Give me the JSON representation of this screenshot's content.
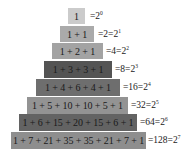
{
  "rows": [
    {
      "n": 0,
      "expression": "1",
      "sum_text": "=2",
      "exponent": "0",
      "color": "#cbcbcb"
    },
    {
      "n": 1,
      "expression": "1 + 1",
      "sum_text": "=2=2",
      "exponent": "1",
      "color": "#aaaaaa"
    },
    {
      "n": 2,
      "expression": "1 + 2 + 1",
      "sum_text": "=4=2",
      "exponent": "2",
      "color": "#a3a3a3"
    },
    {
      "n": 3,
      "expression": "1 + 3 + 3 + 1",
      "sum_text": "=8=2",
      "exponent": "3",
      "color": "#545454"
    },
    {
      "n": 4,
      "expression": "1 + 4 + 6 + 4 + 1",
      "sum_text": "=16=2",
      "exponent": "4",
      "color": "#6e6e6e"
    },
    {
      "n": 5,
      "expression": "1 + 5 + 10 + 10 + 5 + 1",
      "sum_text": "=32=2",
      "exponent": "5",
      "color": "#939393"
    },
    {
      "n": 6,
      "expression": "1 + 6 + 15 + 20 + 15 + 6 + 1",
      "sum_text": "=64=2",
      "exponent": "6",
      "color": "#636363"
    },
    {
      "n": 7,
      "expression": "1 + 7 + 21 + 35 + 35 + 21 + 7 + 1",
      "sum_text": "=128=2",
      "exponent": "7",
      "color": "#8e8e8e"
    }
  ]
}
